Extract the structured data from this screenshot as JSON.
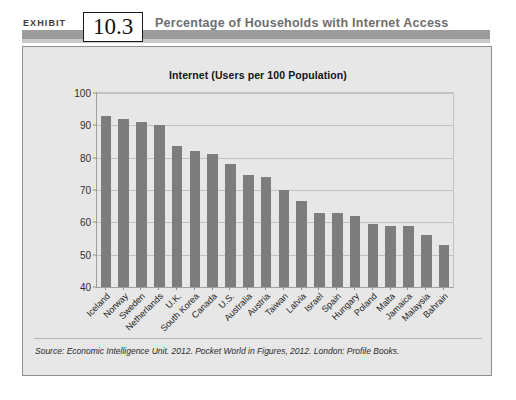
{
  "header": {
    "exhibit_word": "EXHIBIT",
    "exhibit_number": "10.3",
    "title": "Percentage of Households with Internet Access",
    "band_color": "#9c9c9c",
    "title_color": "#6e6e6e"
  },
  "panel": {
    "background_color": "#e7e7e7",
    "border_color": "#8f8f8f"
  },
  "source": {
    "prefix": "Source:",
    "publisher": "Economic Intelligence Unit",
    "year": "2012.",
    "work": "Pocket World in Figures, 2012.",
    "imprint": "London: Profile Books.",
    "full_text": "Source: Economic Intelligence Unit. 2012. Pocket World in Figures, 2012. London: Profile Books."
  },
  "chart_data": {
    "type": "bar",
    "title": "Internet (Users per 100 Population)",
    "xlabel": "",
    "ylabel": "",
    "ylim": [
      40,
      100
    ],
    "ytick_step": 10,
    "yticks": [
      100,
      90,
      80,
      70,
      60,
      50,
      40
    ],
    "grid": true,
    "legend": "none",
    "bar_color": "#7d7d7d",
    "categories": [
      "Iceland",
      "Norway",
      "Sweden",
      "Netherlands",
      "U.K.",
      "South Korea",
      "Canada",
      "U.S.",
      "Australia",
      "Austria",
      "Taiwan",
      "Latvia",
      "Israel",
      "Spain",
      "Hungary",
      "Poland",
      "Malta",
      "Jamaica",
      "Malaysia",
      "Bahrain"
    ],
    "values": [
      93,
      92,
      91,
      90,
      83.5,
      82,
      81,
      78,
      74.5,
      74,
      70,
      66.5,
      63,
      63,
      62,
      59.5,
      59,
      59,
      56,
      53
    ]
  }
}
